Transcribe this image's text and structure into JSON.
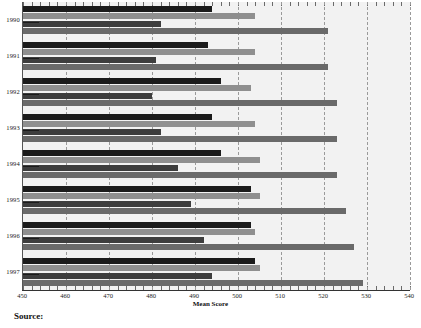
{
  "chart_data": {
    "type": "bar",
    "orientation": "horizontal",
    "title": "",
    "xlabel": "Mean Score",
    "ylabel": "",
    "xlim": [
      450,
      540
    ],
    "xticks": [
      450,
      460,
      470,
      480,
      490,
      500,
      510,
      520,
      530,
      540
    ],
    "grid": true,
    "legend": "none",
    "categories": [
      "1990",
      "1991",
      "1992",
      "1993",
      "1994",
      "1995",
      "1996",
      "1997"
    ],
    "series": [
      {
        "name": "Series 1",
        "color": "#1b1b1b",
        "values": [
          494,
          493,
          496,
          494,
          496,
          503,
          503,
          504
        ]
      },
      {
        "name": "Series 2",
        "color": "#8f8f8f",
        "values": [
          504,
          504,
          503,
          504,
          505,
          505,
          504,
          505
        ]
      },
      {
        "name": "Series 3",
        "color": "#3d3d3d",
        "values": [
          482,
          481,
          480,
          482,
          486,
          489,
          492,
          494
        ]
      },
      {
        "name": "Series 4",
        "color": "#6a6a6a",
        "values": [
          521,
          521,
          523,
          523,
          523,
          525,
          527,
          529
        ]
      }
    ]
  },
  "axis": {
    "x_title": "Mean Score",
    "tick_labels": [
      "450",
      "460",
      "470",
      "480",
      "490",
      "500",
      "510",
      "520",
      "530",
      "540"
    ],
    "year_labels": [
      "1990",
      "1991",
      "1992",
      "1993",
      "1994",
      "1995",
      "1996",
      "1997"
    ]
  },
  "footer": {
    "source_label": "Source:"
  },
  "colors": {
    "series1": "#1b1b1b",
    "series2": "#8f8f8f",
    "series3": "#3d3d3d",
    "series4": "#6a6a6a",
    "plot_background": "#f2f2f2",
    "gridline": "#9a9a9a"
  }
}
